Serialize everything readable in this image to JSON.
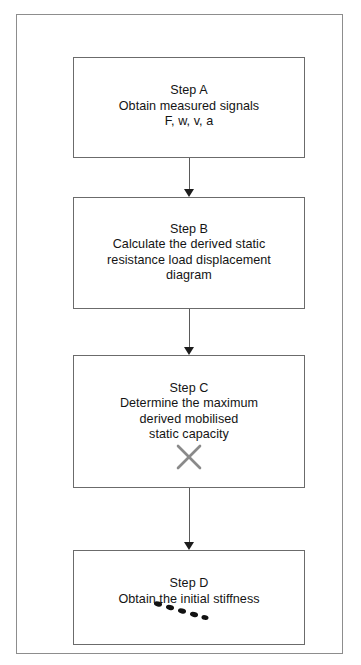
{
  "figure": {
    "type": "flowchart",
    "orientation": "vertical",
    "title": "",
    "border_color": "#8d8d8d",
    "box_border_color": "#6b6b6b",
    "text_color": "#141414",
    "arrow_color": "#1c1c1c",
    "annotation_x_color": "#8a8a8a",
    "annotation_dot_color": "#121212"
  },
  "nodes": [
    {
      "id": "a",
      "label": "Step A",
      "text": "Step A\nObtain measured signals\nF, w, v, a",
      "lines": [
        "Step A",
        "Obtain measured signals",
        "F, w, v, a"
      ]
    },
    {
      "id": "b",
      "label": "Step B",
      "text": "Step B\nCalculate the derived static\nresistance load displacement\ndiagram",
      "lines": [
        "Step B",
        "Calculate the derived static",
        "resistance load displacement",
        "diagram"
      ]
    },
    {
      "id": "c",
      "label": "Step C",
      "text": "Step C\nDetermine the maximum\nderived mobilised\nstatic capacity",
      "lines": [
        "Step C",
        "Determine the maximum",
        "derived mobilised",
        "static capacity"
      ],
      "annotation": "x-mark"
    },
    {
      "id": "d",
      "label": "Step D",
      "text": "Step D\nObtain the initial stiffness",
      "lines": [
        "Step D",
        "Obtain the initial stiffness"
      ],
      "annotation": "dotted-stiffness-line"
    }
  ],
  "connectors": [
    {
      "id": "ab",
      "from": "a",
      "to": "b",
      "style": "solid-arrow-down"
    },
    {
      "id": "bc",
      "from": "b",
      "to": "c",
      "style": "solid-arrow-down"
    },
    {
      "id": "cd",
      "from": "c",
      "to": "d",
      "style": "solid-arrow-down"
    }
  ],
  "annotations": {
    "x_mark": "✕",
    "dotted_line_dash_count": 5
  }
}
